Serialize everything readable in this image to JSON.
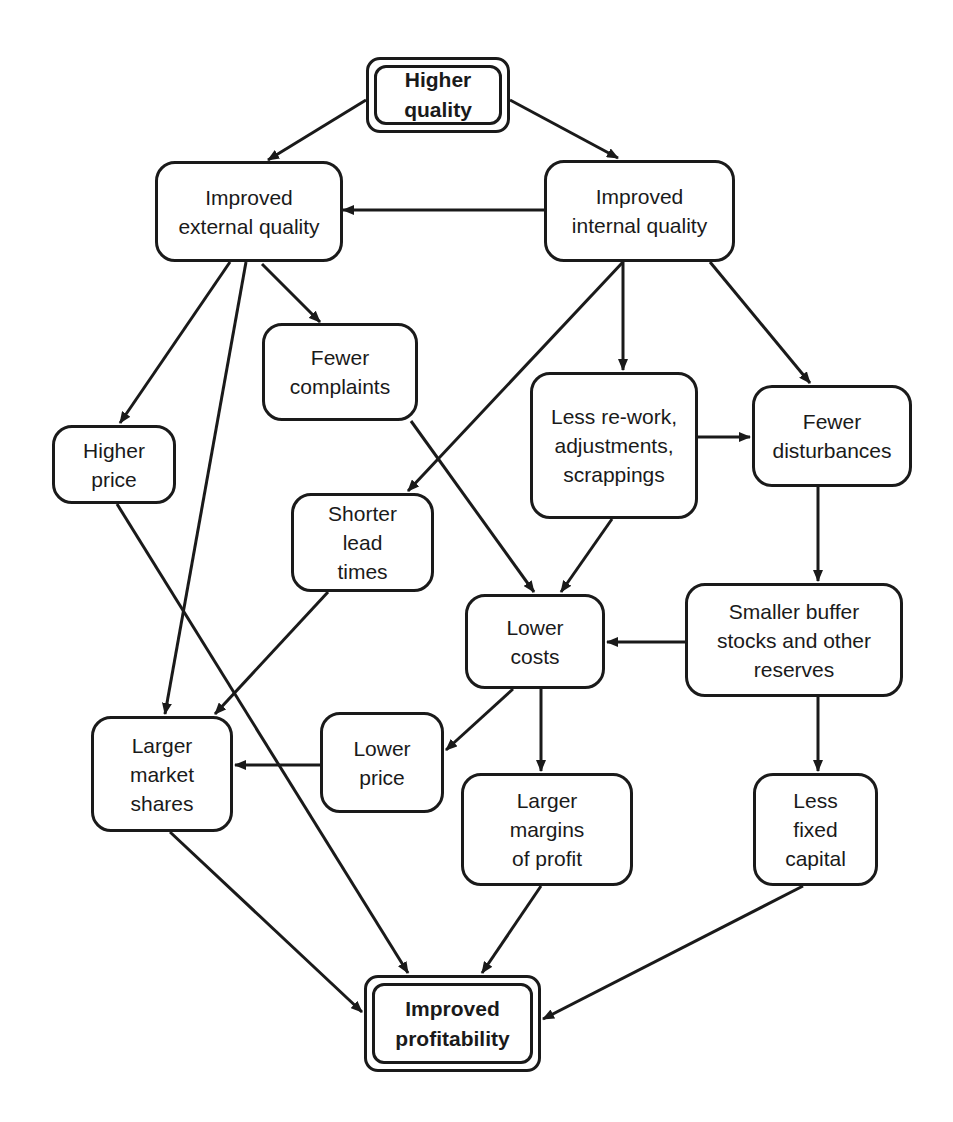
{
  "diagram": {
    "type": "cause-effect flow diagram",
    "stroke_color": "#1a1a1a",
    "background_color": "#ffffff",
    "nodes": [
      {
        "id": "higher_quality",
        "label": "Higher\nquality",
        "style": "double-border-bold",
        "box": [
          366,
          57,
          144,
          76
        ]
      },
      {
        "id": "improved_external_quality",
        "label": "Improved\nexternal quality",
        "box": [
          155,
          161,
          188,
          101
        ]
      },
      {
        "id": "improved_internal_quality",
        "label": "Improved\ninternal quality",
        "box": [
          544,
          160,
          191,
          102
        ]
      },
      {
        "id": "fewer_complaints",
        "label": "Fewer\ncomplaints",
        "box": [
          262,
          323,
          156,
          98
        ]
      },
      {
        "id": "higher_price",
        "label": "Higher\nprice",
        "box": [
          52,
          425,
          124,
          79
        ]
      },
      {
        "id": "less_rework",
        "label": "Less re-work,\nadjustments,\nscrappings",
        "box": [
          530,
          372,
          168,
          147
        ]
      },
      {
        "id": "fewer_disturbances",
        "label": "Fewer\ndisturbances",
        "box": [
          752,
          385,
          160,
          102
        ]
      },
      {
        "id": "shorter_lead_times",
        "label": "Shorter\nlead\ntimes",
        "box": [
          291,
          493,
          143,
          99
        ]
      },
      {
        "id": "lower_costs",
        "label": "Lower\ncosts",
        "box": [
          465,
          594,
          140,
          95
        ]
      },
      {
        "id": "smaller_buffer_stocks",
        "label": "Smaller buffer\nstocks and other\nreserves",
        "box": [
          685,
          583,
          218,
          114
        ]
      },
      {
        "id": "larger_market_shares",
        "label": "Larger\nmarket\nshares",
        "box": [
          91,
          716,
          142,
          116
        ]
      },
      {
        "id": "lower_price",
        "label": "Lower\nprice",
        "box": [
          320,
          712,
          124,
          101
        ]
      },
      {
        "id": "larger_margins_of_profit",
        "label": "Larger\nmargins\nof profit",
        "box": [
          461,
          773,
          172,
          113
        ]
      },
      {
        "id": "less_fixed_capital",
        "label": "Less\nfixed\ncapital",
        "box": [
          753,
          773,
          125,
          113
        ]
      },
      {
        "id": "improved_profitability",
        "label": "Improved\nprofitability",
        "style": "double-border-bold",
        "box": [
          364,
          975,
          177,
          97
        ]
      }
    ],
    "edges": [
      {
        "from": "higher_quality",
        "to": "improved_external_quality",
        "points": [
          [
            366,
            100
          ],
          [
            268,
            160
          ]
        ]
      },
      {
        "from": "higher_quality",
        "to": "improved_internal_quality",
        "points": [
          [
            510,
            100
          ],
          [
            618,
            158
          ]
        ]
      },
      {
        "from": "improved_internal_quality",
        "to": "improved_external_quality",
        "points": [
          [
            544,
            210
          ],
          [
            343,
            210
          ]
        ]
      },
      {
        "from": "improved_external_quality",
        "to": "higher_price",
        "points": [
          [
            230,
            262
          ],
          [
            120,
            423
          ]
        ]
      },
      {
        "from": "improved_external_quality",
        "to": "larger_market_shares",
        "points": [
          [
            246,
            262
          ],
          [
            165,
            714
          ]
        ]
      },
      {
        "from": "improved_external_quality",
        "to": "fewer_complaints",
        "points": [
          [
            262,
            264
          ],
          [
            320,
            322
          ]
        ]
      },
      {
        "from": "improved_internal_quality",
        "to": "shorter_lead_times",
        "points": [
          [
            623,
            262
          ],
          [
            408,
            491
          ]
        ]
      },
      {
        "from": "improved_internal_quality",
        "to": "less_rework",
        "points": [
          [
            623,
            262
          ],
          [
            623,
            370
          ]
        ]
      },
      {
        "from": "improved_internal_quality",
        "to": "fewer_disturbances",
        "points": [
          [
            710,
            262
          ],
          [
            810,
            383
          ]
        ]
      },
      {
        "from": "less_rework",
        "to": "fewer_disturbances",
        "points": [
          [
            698,
            437
          ],
          [
            750,
            437
          ]
        ]
      },
      {
        "from": "fewer_complaints",
        "to": "lower_costs",
        "points": [
          [
            411,
            421
          ],
          [
            534,
            592
          ]
        ]
      },
      {
        "from": "less_rework",
        "to": "lower_costs",
        "points": [
          [
            612,
            519
          ],
          [
            561,
            592
          ]
        ]
      },
      {
        "from": "fewer_disturbances",
        "to": "smaller_buffer_stocks",
        "points": [
          [
            818,
            487
          ],
          [
            818,
            581
          ]
        ]
      },
      {
        "from": "smaller_buffer_stocks",
        "to": "lower_costs",
        "points": [
          [
            685,
            642
          ],
          [
            607,
            642
          ]
        ]
      },
      {
        "from": "smaller_buffer_stocks",
        "to": "less_fixed_capital",
        "points": [
          [
            818,
            697
          ],
          [
            818,
            771
          ]
        ]
      },
      {
        "from": "shorter_lead_times",
        "to": "larger_market_shares",
        "points": [
          [
            328,
            592
          ],
          [
            215,
            714
          ]
        ]
      },
      {
        "from": "lower_costs",
        "to": "lower_price",
        "points": [
          [
            513,
            689
          ],
          [
            446,
            750
          ]
        ]
      },
      {
        "from": "lower_costs",
        "to": "larger_margins_of_profit",
        "points": [
          [
            541,
            689
          ],
          [
            541,
            771
          ]
        ]
      },
      {
        "from": "lower_price",
        "to": "larger_market_shares",
        "points": [
          [
            320,
            765
          ],
          [
            235,
            765
          ]
        ]
      },
      {
        "from": "higher_price",
        "to": "improved_profitability",
        "points": [
          [
            117,
            504
          ],
          [
            408,
            973
          ]
        ]
      },
      {
        "from": "larger_market_shares",
        "to": "improved_profitability",
        "points": [
          [
            170,
            832
          ],
          [
            362,
            1012
          ]
        ]
      },
      {
        "from": "larger_margins_of_profit",
        "to": "improved_profitability",
        "points": [
          [
            541,
            886
          ],
          [
            482,
            973
          ]
        ]
      },
      {
        "from": "less_fixed_capital",
        "to": "improved_profitability",
        "points": [
          [
            803,
            886
          ],
          [
            543,
            1019
          ]
        ]
      }
    ]
  }
}
